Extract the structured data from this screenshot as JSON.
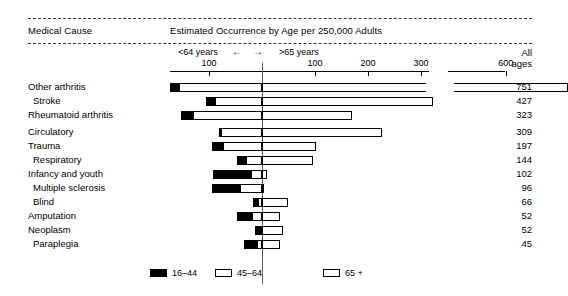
{
  "header": {
    "cause_column_title": "Medical Cause",
    "occurrence_column_title": "Estimated Occurrence by Age per 250,000 Adults",
    "all_ages_line1": "All",
    "all_ages_line2": "ages",
    "left_direction_label": "<64 years",
    "right_direction_label": ">65 years",
    "arrow_left": "←",
    "arrow_right": "→"
  },
  "axis": {
    "left_ticks": [
      {
        "label": "100",
        "value": 100
      }
    ],
    "right_ticks": [
      {
        "label": "100",
        "value": 100
      },
      {
        "label": "200",
        "value": 200
      },
      {
        "label": "300",
        "value": 300
      }
    ],
    "far_ticks": [
      {
        "label": "600",
        "value": 600
      }
    ]
  },
  "legend": {
    "items": [
      {
        "label": "16–44",
        "swatch": "black"
      },
      {
        "label": "45–64",
        "swatch": "white"
      },
      {
        "label": "65 +",
        "swatch": "white"
      }
    ]
  },
  "chart_data": {
    "type": "bar",
    "title": "Estimated Occurrence by Age per 250,000 Adults",
    "xlabel": "Estimated occurrence per 250,000 adults",
    "ylabel": "Medical Cause",
    "orientation": "horizontal",
    "stacked": true,
    "grid": false,
    "legend_position": "bottom",
    "series": [
      {
        "name": "16–44",
        "color": "#000000"
      },
      {
        "name": "45–64",
        "color": "#ffffff"
      },
      {
        "name": "65 +",
        "color": "#ffffff"
      }
    ],
    "categories": [
      "Other arthritis",
      "Stroke",
      "Rheumatoid arthritis",
      "Circulatory",
      "Trauma",
      "Respiratory",
      "Infancy and youth",
      "Multiple sclerosis",
      "Blind",
      "Amputation",
      "Neoplasm",
      "Paraplegia"
    ],
    "all_ages": [
      751,
      427,
      323,
      309,
      197,
      144,
      102,
      96,
      66,
      52,
      52,
      45
    ],
    "rows": [
      {
        "category": "Other arthritis",
        "young": 17,
        "mid": 157,
        "old": 577,
        "all_ages": 751,
        "axis_break": true
      },
      {
        "category": "Stroke",
        "young": 16,
        "mid": 89,
        "old": 322,
        "all_ages": 427
      },
      {
        "category": "Rheumatoid arthritis",
        "young": 23,
        "mid": 130,
        "old": 170,
        "all_ages": 323
      },
      {
        "category": "Circulatory",
        "young": 4,
        "mid": 78,
        "old": 227,
        "all_ages": 309
      },
      {
        "category": "Trauma",
        "young": 21,
        "mid": 74,
        "old": 102,
        "all_ages": 197
      },
      {
        "category": "Respiratory",
        "young": 17,
        "mid": 31,
        "old": 96,
        "all_ages": 144
      },
      {
        "category": "Infancy and youth",
        "young": 73,
        "mid": 20,
        "old": 9,
        "all_ages": 102
      },
      {
        "category": "Multiple sclerosis",
        "young": 53,
        "mid": 41,
        "old": 2,
        "all_ages": 96
      },
      {
        "category": "Blind",
        "young": 9,
        "mid": 8,
        "old": 49,
        "all_ages": 66
      },
      {
        "category": "Amputation",
        "young": 29,
        "mid": 19,
        "old": 34,
        "all_ages": 52
      },
      {
        "category": "Neoplasm",
        "young": 9,
        "mid": 4,
        "old": 39,
        "all_ages": 52
      },
      {
        "category": "Paraplegia",
        "young": 24,
        "mid": 10,
        "old": 34,
        "all_ages": 45
      }
    ]
  }
}
